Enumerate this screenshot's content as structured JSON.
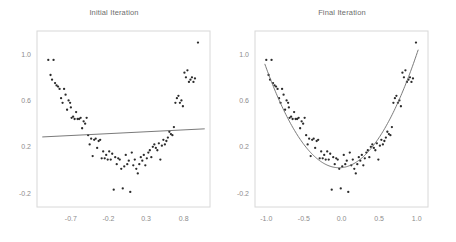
{
  "figure": {
    "background_color": "#ffffff",
    "point_color": "#2b2b2b",
    "line_color": "#6b6b6b",
    "frame_color": "#d8d8d8",
    "tick_label_color": "#8c8c8c",
    "title_color": "#6d6d6d"
  },
  "chart_data": [
    {
      "type": "scatter",
      "title": "Initial Iteration",
      "xlabel": "",
      "ylabel": "",
      "xlim": [
        -1.15,
        1.15
      ],
      "ylim": [
        -0.32,
        1.2
      ],
      "xticks": [
        -0.7,
        -0.2,
        0.3,
        0.8
      ],
      "xticklabels": [
        "-0.7",
        "-0.2",
        "0.3",
        "0.8"
      ],
      "yticks": [
        1.0,
        0.6,
        0.2,
        -0.2
      ],
      "yticklabels": [
        "1.0",
        "0.6",
        "0.2",
        "-0.2"
      ],
      "grid": false,
      "legend": "none",
      "series": [
        {
          "name": "observations",
          "type": "scatter",
          "x": [
            -1.0,
            -0.97,
            -0.95,
            -0.93,
            -0.91,
            -0.89,
            -0.87,
            -0.85,
            -0.83,
            -0.81,
            -0.79,
            -0.77,
            -0.75,
            -0.73,
            -0.71,
            -0.7,
            -0.69,
            -0.67,
            -0.65,
            -0.63,
            -0.61,
            -0.59,
            -0.57,
            -0.55,
            -0.53,
            -0.51,
            -0.49,
            -0.47,
            -0.45,
            -0.43,
            -0.41,
            -0.39,
            -0.37,
            -0.35,
            -0.33,
            -0.31,
            -0.29,
            -0.27,
            -0.25,
            -0.23,
            -0.21,
            -0.19,
            -0.17,
            -0.15,
            -0.13,
            -0.11,
            -0.09,
            -0.07,
            -0.05,
            -0.03,
            -0.01,
            0.01,
            0.03,
            0.05,
            0.07,
            0.09,
            0.11,
            0.13,
            0.15,
            0.17,
            0.19,
            0.21,
            0.23,
            0.25,
            0.27,
            0.29,
            0.31,
            0.33,
            0.35,
            0.37,
            0.39,
            0.41,
            0.43,
            0.45,
            0.47,
            0.49,
            0.51,
            0.53,
            0.55,
            0.57,
            0.59,
            0.61,
            0.63,
            0.65,
            0.67,
            0.69,
            0.71,
            0.73,
            0.75,
            0.77,
            0.79,
            0.81,
            0.83,
            0.85,
            0.87,
            0.89,
            0.91,
            0.93,
            0.95,
            0.99
          ],
          "y": [
            0.95,
            0.82,
            0.78,
            0.95,
            0.75,
            0.73,
            0.72,
            0.7,
            0.62,
            0.58,
            0.7,
            0.65,
            0.52,
            0.6,
            0.58,
            0.54,
            0.45,
            0.46,
            0.44,
            0.5,
            0.44,
            0.44,
            0.45,
            0.36,
            0.42,
            0.4,
            0.45,
            0.3,
            0.22,
            0.27,
            0.12,
            0.26,
            0.27,
            0.19,
            0.25,
            0.26,
            0.1,
            0.16,
            0.1,
            0.13,
            0.09,
            0.16,
            0.09,
            0.14,
            -0.17,
            0.11,
            0.05,
            0.1,
            0.09,
            0.01,
            -0.16,
            0.03,
            0.13,
            0.05,
            0.08,
            -0.19,
            0.15,
            0.04,
            0.09,
            0.01,
            -0.03,
            0.05,
            0.11,
            0.08,
            0.13,
            0.04,
            0.1,
            0.15,
            0.17,
            0.11,
            0.2,
            0.22,
            0.19,
            0.17,
            0.23,
            0.09,
            0.21,
            0.26,
            0.22,
            0.25,
            0.28,
            0.33,
            0.31,
            0.3,
            0.37,
            0.58,
            0.62,
            0.64,
            0.58,
            0.6,
            0.55,
            0.84,
            0.8,
            0.86,
            0.76,
            0.78,
            0.8,
            0.76,
            0.79,
            1.1
          ]
        },
        {
          "name": "fit",
          "type": "line",
          "description": "near-flat initial linear fit",
          "x": [
            -1.08,
            1.08
          ],
          "y": [
            0.285,
            0.355
          ]
        }
      ]
    },
    {
      "type": "scatter",
      "title": "Final Iteration",
      "xlabel": "",
      "ylabel": "",
      "xlim": [
        -1.15,
        1.15
      ],
      "ylim": [
        -0.32,
        1.2
      ],
      "xticks": [
        -1.0,
        -0.5,
        0.0,
        0.5,
        1.0
      ],
      "xticklabels": [
        "-1.0",
        "-0.5",
        "0.0",
        "0.5",
        "1.0"
      ],
      "yticks": [
        1.0,
        0.6,
        0.2,
        -0.2
      ],
      "yticklabels": [
        "1.0",
        "0.6",
        "0.2",
        "-0.2"
      ],
      "grid": false,
      "legend": "none",
      "series": [
        {
          "name": "observations",
          "type": "scatter",
          "x": [
            -1.0,
            -0.97,
            -0.95,
            -0.93,
            -0.91,
            -0.89,
            -0.87,
            -0.85,
            -0.83,
            -0.81,
            -0.79,
            -0.77,
            -0.75,
            -0.73,
            -0.71,
            -0.7,
            -0.69,
            -0.67,
            -0.65,
            -0.63,
            -0.61,
            -0.59,
            -0.57,
            -0.55,
            -0.53,
            -0.51,
            -0.49,
            -0.47,
            -0.45,
            -0.43,
            -0.41,
            -0.39,
            -0.37,
            -0.35,
            -0.33,
            -0.31,
            -0.29,
            -0.27,
            -0.25,
            -0.23,
            -0.21,
            -0.19,
            -0.17,
            -0.15,
            -0.13,
            -0.11,
            -0.09,
            -0.07,
            -0.05,
            -0.03,
            -0.01,
            0.01,
            0.03,
            0.05,
            0.07,
            0.09,
            0.11,
            0.13,
            0.15,
            0.17,
            0.19,
            0.21,
            0.23,
            0.25,
            0.27,
            0.29,
            0.31,
            0.33,
            0.35,
            0.37,
            0.39,
            0.41,
            0.43,
            0.45,
            0.47,
            0.49,
            0.51,
            0.53,
            0.55,
            0.57,
            0.59,
            0.61,
            0.63,
            0.65,
            0.67,
            0.69,
            0.71,
            0.73,
            0.75,
            0.77,
            0.79,
            0.81,
            0.83,
            0.85,
            0.87,
            0.89,
            0.91,
            0.93,
            0.95,
            0.99
          ],
          "y": [
            0.95,
            0.82,
            0.78,
            0.95,
            0.75,
            0.73,
            0.72,
            0.7,
            0.62,
            0.58,
            0.7,
            0.65,
            0.52,
            0.6,
            0.58,
            0.54,
            0.45,
            0.46,
            0.44,
            0.5,
            0.44,
            0.44,
            0.45,
            0.36,
            0.42,
            0.4,
            0.45,
            0.3,
            0.22,
            0.27,
            0.12,
            0.26,
            0.27,
            0.19,
            0.25,
            0.26,
            0.1,
            0.16,
            0.1,
            0.13,
            0.09,
            0.16,
            0.09,
            0.14,
            -0.17,
            0.11,
            0.05,
            0.1,
            0.09,
            0.01,
            -0.16,
            0.03,
            0.13,
            0.05,
            0.08,
            -0.19,
            0.15,
            0.04,
            0.09,
            0.01,
            -0.03,
            0.05,
            0.11,
            0.08,
            0.13,
            0.04,
            0.1,
            0.15,
            0.17,
            0.11,
            0.2,
            0.22,
            0.19,
            0.17,
            0.23,
            0.09,
            0.21,
            0.26,
            0.22,
            0.25,
            0.28,
            0.33,
            0.31,
            0.3,
            0.37,
            0.58,
            0.62,
            0.64,
            0.58,
            0.6,
            0.55,
            0.84,
            0.8,
            0.86,
            0.76,
            0.78,
            0.8,
            0.76,
            0.79,
            1.1
          ]
        },
        {
          "name": "fit",
          "type": "line",
          "description": "converged quadratic fit y = 0.92x^2 + 0.06x + 0.02",
          "coefficients": {
            "a": 0.92,
            "b": 0.06,
            "c": 0.02
          },
          "x_range": [
            -1.02,
            1.02
          ]
        }
      ]
    }
  ]
}
